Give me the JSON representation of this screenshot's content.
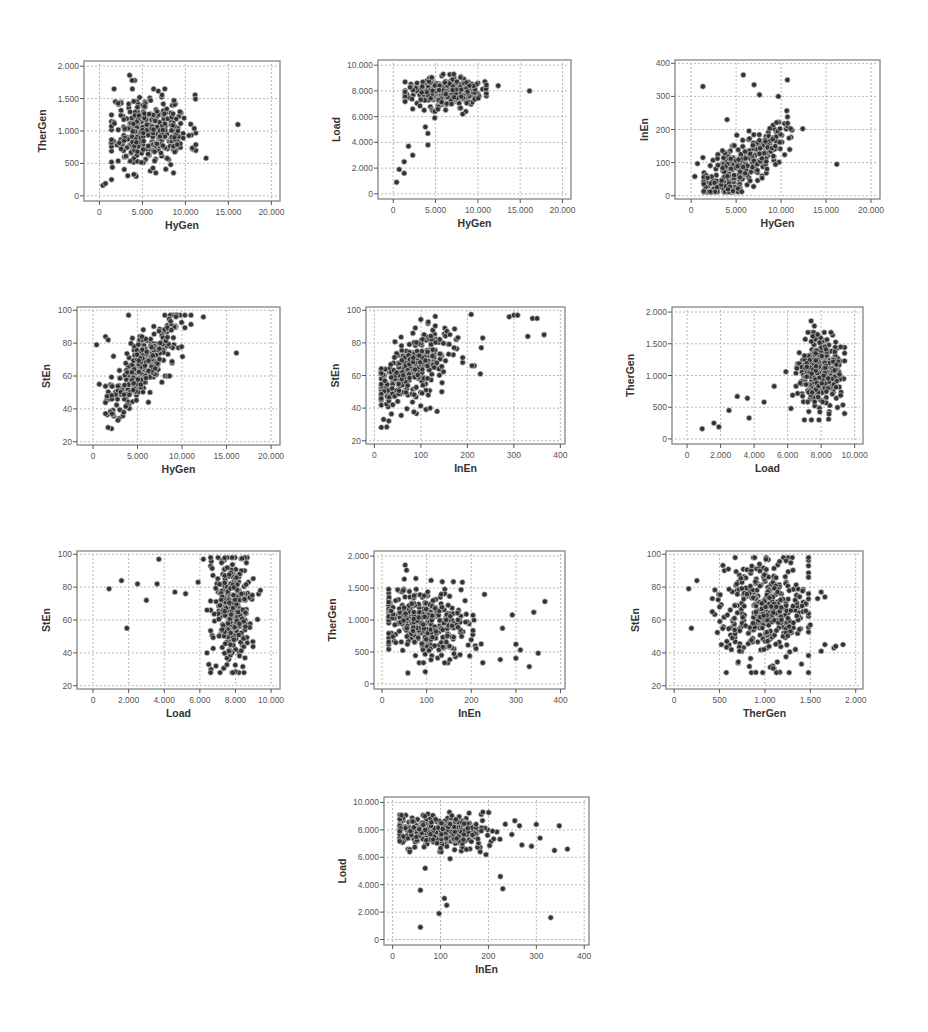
{
  "figure": {
    "style": {
      "frame_color": "#7a7a7a",
      "grid_color": "#b8b8b8",
      "point_fill": "#333333",
      "point_stroke": "#c8c8c8",
      "tick_color": "#555555",
      "label_color": "#333333"
    }
  },
  "chart_data": [
    {
      "id": "thergen-vs-hygen",
      "type": "scatter",
      "xlabel": "HyGen",
      "ylabel": "TherGen",
      "xlim": [
        -1800,
        21000
      ],
      "ylim": [
        -80,
        2080
      ],
      "xticks": [
        0,
        5000,
        10000,
        15000,
        20000
      ],
      "xtick_labels": [
        "0",
        "5.000",
        "10.000",
        "15.000",
        "20.000"
      ],
      "yticks": [
        0,
        500,
        1000,
        1500,
        2000
      ],
      "ytick_labels": [
        "0",
        "500",
        "1.000",
        "1.500",
        "2.000"
      ],
      "grid": true,
      "frame": {
        "left": 84,
        "top": 61,
        "right": 280,
        "bottom": 201
      },
      "outliers": [
        [
          16100,
          1100
        ],
        [
          12400,
          580
        ],
        [
          400,
          160
        ],
        [
          700,
          190
        ],
        [
          1400,
          250
        ],
        [
          1500,
          440
        ],
        [
          4000,
          330
        ],
        [
          3500,
          1860
        ],
        [
          4100,
          1780
        ],
        [
          3800,
          1780
        ],
        [
          7600,
          1650
        ],
        [
          10400,
          930
        ]
      ],
      "cluster": {
        "x_center": 5800,
        "x_spread": 2300,
        "y_center": 1000,
        "y_spread": 280,
        "n": 330,
        "seed": 11,
        "x_min": 1400,
        "x_max": 11200,
        "y_min": 300,
        "y_max": 1650,
        "trend": -6e-05
      }
    },
    {
      "id": "load-vs-hygen",
      "type": "scatter",
      "xlabel": "HyGen",
      "ylabel": "Load",
      "xlim": [
        -1800,
        21000
      ],
      "ylim": [
        -400,
        10400
      ],
      "xticks": [
        0,
        5000,
        10000,
        15000,
        20000
      ],
      "xtick_labels": [
        "0",
        "5.000",
        "10.000",
        "15.000",
        "20.000"
      ],
      "yticks": [
        0,
        2000,
        4000,
        6000,
        8000,
        10000
      ],
      "ytick_labels": [
        "0",
        "2.000",
        "4.000",
        "6.000",
        "8.000",
        "10.000"
      ],
      "grid": true,
      "frame": {
        "left": 378,
        "top": 60,
        "right": 571,
        "bottom": 199
      },
      "outliers": [
        [
          16100,
          8000
        ],
        [
          12400,
          8400
        ],
        [
          400,
          900
        ],
        [
          700,
          1900
        ],
        [
          1300,
          2500
        ],
        [
          1300,
          1600
        ],
        [
          1800,
          3700
        ],
        [
          2300,
          3000
        ],
        [
          3800,
          5200
        ],
        [
          4100,
          4700
        ],
        [
          4100,
          3800
        ],
        [
          4900,
          5900
        ],
        [
          8200,
          6200
        ],
        [
          2300,
          6600
        ]
      ],
      "cluster": {
        "x_center": 6000,
        "x_spread": 2200,
        "y_center": 7900,
        "y_spread": 550,
        "n": 320,
        "seed": 23,
        "x_min": 1400,
        "x_max": 11000,
        "y_min": 6400,
        "y_max": 9300,
        "trend": 3e-05
      }
    },
    {
      "id": "inen-vs-hygen",
      "type": "scatter",
      "xlabel": "HyGen",
      "ylabel": "InEn",
      "xlim": [
        -1800,
        21000
      ],
      "ylim": [
        -10,
        410
      ],
      "xticks": [
        0,
        5000,
        10000,
        15000,
        20000
      ],
      "xtick_labels": [
        "0",
        "5.000",
        "10.000",
        "15.000",
        "20.000"
      ],
      "yticks": [
        0,
        100,
        200,
        300,
        400
      ],
      "ytick_labels": [
        "0",
        "100",
        "200",
        "300",
        "400"
      ],
      "grid": true,
      "frame": {
        "left": 675,
        "top": 60,
        "right": 880,
        "bottom": 199
      },
      "outliers": [
        [
          16200,
          95
        ],
        [
          12400,
          202
        ],
        [
          1300,
          330
        ],
        [
          5800,
          365
        ],
        [
          7000,
          335
        ],
        [
          10700,
          350
        ],
        [
          9700,
          300
        ],
        [
          4000,
          230
        ],
        [
          400,
          58
        ],
        [
          700,
          97
        ],
        [
          1300,
          115
        ],
        [
          7600,
          305
        ]
      ],
      "cluster": {
        "x_center": 5600,
        "x_spread": 2400,
        "y_center": 95,
        "y_spread": 40,
        "n": 330,
        "seed": 37,
        "x_min": 1400,
        "x_max": 11200,
        "y_min": 12,
        "y_max": 290,
        "trend": 0.018
      }
    },
    {
      "id": "sten-vs-hygen",
      "type": "scatter",
      "xlabel": "HyGen",
      "ylabel": "StEn",
      "xlim": [
        -1800,
        21000
      ],
      "ylim": [
        18,
        102
      ],
      "xticks": [
        0,
        5000,
        10000,
        15000,
        20000
      ],
      "xtick_labels": [
        "0",
        "5.000",
        "10.000",
        "15.000",
        "20.000"
      ],
      "yticks": [
        20,
        40,
        60,
        80,
        100
      ],
      "ytick_labels": [
        "20",
        "40",
        "60",
        "80",
        "100"
      ],
      "grid": true,
      "frame": {
        "left": 77,
        "top": 307,
        "right": 280,
        "bottom": 445
      },
      "outliers": [
        [
          16100,
          74
        ],
        [
          12400,
          96
        ],
        [
          400,
          79
        ],
        [
          700,
          55
        ],
        [
          1400,
          84
        ],
        [
          1700,
          82
        ],
        [
          2300,
          72
        ],
        [
          4000,
          97
        ],
        [
          6400,
          50
        ],
        [
          8600,
          60
        ]
      ],
      "cluster": {
        "x_center": 5600,
        "x_spread": 2200,
        "y_center": 66,
        "y_spread": 9,
        "n": 330,
        "seed": 41,
        "x_min": 1400,
        "x_max": 11000,
        "y_min": 28,
        "y_max": 97,
        "trend": 0.006
      }
    },
    {
      "id": "sten-vs-inen",
      "type": "scatter",
      "xlabel": "InEn",
      "ylabel": "StEn",
      "xlim": [
        -18,
        410
      ],
      "ylim": [
        18,
        102
      ],
      "xticks": [
        0,
        100,
        200,
        300,
        400
      ],
      "xtick_labels": [
        "0",
        "100",
        "200",
        "300",
        "400"
      ],
      "yticks": [
        20,
        40,
        60,
        80,
        100
      ],
      "ytick_labels": [
        "20",
        "40",
        "60",
        "80",
        "100"
      ],
      "grid": true,
      "frame": {
        "left": 366,
        "top": 307,
        "right": 565,
        "bottom": 444
      },
      "outliers": [
        [
          365,
          85
        ],
        [
          330,
          84
        ],
        [
          340,
          95
        ],
        [
          350,
          95
        ],
        [
          300,
          97
        ],
        [
          308,
          97
        ],
        [
          290,
          96
        ],
        [
          228,
          61
        ],
        [
          215,
          66
        ],
        [
          210,
          66
        ],
        [
          230,
          77
        ],
        [
          190,
          68
        ],
        [
          190,
          71
        ],
        [
          153,
          69
        ],
        [
          145,
          50
        ],
        [
          135,
          38
        ],
        [
          116,
          48
        ],
        [
          120,
          40
        ],
        [
          233,
          83
        ]
      ],
      "cluster": {
        "x_center": 85,
        "x_spread": 45,
        "y_center": 64,
        "y_spread": 10,
        "n": 340,
        "seed": 53,
        "x_min": 15,
        "x_max": 260,
        "y_min": 28,
        "y_max": 98,
        "trend": 0.2
      }
    },
    {
      "id": "thergen-vs-load",
      "type": "scatter",
      "xlabel": "Load",
      "ylabel": "TherGen",
      "xlim": [
        -900,
        10500
      ],
      "ylim": [
        -80,
        2080
      ],
      "xticks": [
        0,
        2000,
        4000,
        6000,
        8000,
        10000
      ],
      "xtick_labels": [
        "0",
        "2.000",
        "4.000",
        "6.000",
        "8.000",
        "10.000"
      ],
      "yticks": [
        0,
        500,
        1000,
        1500,
        2000
      ],
      "ytick_labels": [
        "0",
        "500",
        "1.000",
        "1.500",
        "2.000"
      ],
      "grid": true,
      "frame": {
        "left": 672,
        "top": 307,
        "right": 863,
        "bottom": 444
      },
      "outliers": [
        [
          900,
          160
        ],
        [
          1600,
          250
        ],
        [
          1900,
          190
        ],
        [
          2500,
          450
        ],
        [
          3000,
          670
        ],
        [
          3600,
          640
        ],
        [
          3700,
          330
        ],
        [
          4600,
          580
        ],
        [
          5200,
          830
        ],
        [
          5900,
          1060
        ],
        [
          6200,
          480
        ],
        [
          6300,
          690
        ],
        [
          7400,
          1860
        ],
        [
          7600,
          1780
        ],
        [
          7500,
          1620
        ]
      ],
      "cluster": {
        "x_center": 7900,
        "x_spread": 600,
        "y_center": 1000,
        "y_spread": 280,
        "n": 330,
        "seed": 67,
        "x_min": 6500,
        "x_max": 9400,
        "y_min": 300,
        "y_max": 1680,
        "trend": 0
      }
    },
    {
      "id": "sten-vs-load",
      "type": "scatter",
      "xlabel": "Load",
      "ylabel": "StEn",
      "xlim": [
        -900,
        10500
      ],
      "ylim": [
        18,
        102
      ],
      "xticks": [
        0,
        2000,
        4000,
        6000,
        8000,
        10000
      ],
      "xtick_labels": [
        "0",
        "2.000",
        "4.000",
        "6.000",
        "8.000",
        "10.000"
      ],
      "yticks": [
        20,
        40,
        60,
        80,
        100
      ],
      "ytick_labels": [
        "20",
        "40",
        "60",
        "80",
        "100"
      ],
      "grid": true,
      "frame": {
        "left": 77,
        "top": 551,
        "right": 280,
        "bottom": 689
      },
      "outliers": [
        [
          900,
          79
        ],
        [
          1600,
          84
        ],
        [
          1900,
          55
        ],
        [
          2500,
          82
        ],
        [
          3000,
          72
        ],
        [
          3600,
          82
        ],
        [
          3700,
          97
        ],
        [
          4600,
          77
        ],
        [
          5200,
          76
        ],
        [
          5900,
          83
        ],
        [
          6200,
          97
        ],
        [
          6400,
          66
        ],
        [
          6400,
          40
        ],
        [
          6500,
          33
        ],
        [
          9400,
          78
        ]
      ],
      "cluster": {
        "x_center": 7800,
        "x_spread": 550,
        "y_center": 65,
        "y_spread": 17,
        "n": 340,
        "seed": 71,
        "x_min": 6600,
        "x_max": 9300,
        "y_min": 28,
        "y_max": 98,
        "trend": 0
      }
    },
    {
      "id": "thergen-vs-inen",
      "type": "scatter",
      "xlabel": "InEn",
      "ylabel": "TherGen",
      "xlim": [
        -18,
        410
      ],
      "ylim": [
        -80,
        2080
      ],
      "xticks": [
        0,
        100,
        200,
        300,
        400
      ],
      "xtick_labels": [
        "0",
        "100",
        "200",
        "300",
        "400"
      ],
      "yticks": [
        0,
        500,
        1000,
        1500,
        2000
      ],
      "ytick_labels": [
        "0",
        "500",
        "1.000",
        "1.500",
        "2.000"
      ],
      "grid": true,
      "frame": {
        "left": 374,
        "top": 551,
        "right": 565,
        "bottom": 689
      },
      "outliers": [
        [
          365,
          1290
        ],
        [
          340,
          1120
        ],
        [
          350,
          480
        ],
        [
          330,
          270
        ],
        [
          300,
          620
        ],
        [
          310,
          530
        ],
        [
          300,
          400
        ],
        [
          292,
          1080
        ],
        [
          270,
          870
        ],
        [
          265,
          380
        ],
        [
          58,
          170
        ],
        [
          97,
          190
        ],
        [
          52,
          1860
        ],
        [
          55,
          1780
        ],
        [
          50,
          1640
        ],
        [
          76,
          1650
        ],
        [
          110,
          1620
        ],
        [
          160,
          1600
        ],
        [
          180,
          1590
        ],
        [
          135,
          1600
        ]
      ],
      "cluster": {
        "x_center": 95,
        "x_spread": 55,
        "y_center": 960,
        "y_spread": 260,
        "n": 340,
        "seed": 83,
        "x_min": 15,
        "x_max": 255,
        "y_min": 330,
        "y_max": 1480,
        "trend": -1.6
      }
    },
    {
      "id": "sten-vs-thergen",
      "type": "scatter",
      "xlabel": "TherGen",
      "ylabel": "StEn",
      "xlim": [
        -90,
        2080
      ],
      "ylim": [
        18,
        102
      ],
      "xticks": [
        0,
        500,
        1000,
        1500,
        2000
      ],
      "xtick_labels": [
        "0",
        "500",
        "1.000",
        "1.500",
        "2.000"
      ],
      "yticks": [
        20,
        40,
        60,
        80,
        100
      ],
      "ytick_labels": [
        "20",
        "40",
        "60",
        "80",
        "100"
      ],
      "grid": true,
      "frame": {
        "left": 666,
        "top": 551,
        "right": 863,
        "bottom": 689
      },
      "outliers": [
        [
          160,
          79
        ],
        [
          190,
          55
        ],
        [
          250,
          84
        ],
        [
          420,
          73
        ],
        [
          420,
          65
        ],
        [
          500,
          68
        ],
        [
          520,
          45
        ],
        [
          580,
          47
        ],
        [
          630,
          42
        ],
        [
          720,
          41
        ],
        [
          1620,
          41
        ],
        [
          1660,
          45
        ],
        [
          1760,
          43
        ],
        [
          1780,
          44
        ],
        [
          1860,
          45
        ],
        [
          1580,
          73
        ],
        [
          1620,
          77
        ],
        [
          1660,
          74
        ],
        [
          1480,
          86
        ],
        [
          1500,
          57
        ]
      ],
      "cluster": {
        "x_center": 1000,
        "x_spread": 260,
        "y_center": 66,
        "y_spread": 17,
        "n": 380,
        "seed": 97,
        "x_min": 300,
        "x_max": 1480,
        "y_min": 28,
        "y_max": 98,
        "trend": 0
      }
    },
    {
      "id": "load-vs-inen",
      "type": "scatter",
      "xlabel": "InEn",
      "ylabel": "Load",
      "xlim": [
        -18,
        410
      ],
      "ylim": [
        -400,
        10400
      ],
      "xticks": [
        0,
        100,
        200,
        300,
        400
      ],
      "xtick_labels": [
        "0",
        "100",
        "200",
        "300",
        "400"
      ],
      "yticks": [
        0,
        2000,
        4000,
        6000,
        8000,
        10000
      ],
      "ytick_labels": [
        "0",
        "2.000",
        "4.000",
        "6.000",
        "8.000",
        "10.000"
      ],
      "grid": true,
      "frame": {
        "left": 384,
        "top": 797,
        "right": 589,
        "bottom": 945
      },
      "outliers": [
        [
          58,
          900
        ],
        [
          58,
          3600
        ],
        [
          68,
          5200
        ],
        [
          97,
          1900
        ],
        [
          108,
          3000
        ],
        [
          113,
          2500
        ],
        [
          120,
          5900
        ],
        [
          225,
          4600
        ],
        [
          230,
          3700
        ],
        [
          330,
          1600
        ],
        [
          195,
          6200
        ],
        [
          300,
          8400
        ],
        [
          348,
          8300
        ],
        [
          338,
          6500
        ],
        [
          365,
          6600
        ],
        [
          290,
          6800
        ],
        [
          270,
          6900
        ],
        [
          265,
          8300
        ],
        [
          308,
          7400
        ]
      ],
      "cluster": {
        "x_center": 95,
        "x_spread": 55,
        "y_center": 7900,
        "y_spread": 600,
        "n": 340,
        "seed": 101,
        "x_min": 15,
        "x_max": 255,
        "y_min": 6400,
        "y_max": 9300,
        "trend": 0
      }
    }
  ]
}
